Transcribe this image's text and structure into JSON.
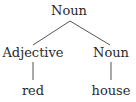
{
  "diagram": {
    "type": "syntax-tree",
    "nodes": {
      "root": {
        "label": "Noun"
      },
      "left": {
        "label": "Adjective"
      },
      "right": {
        "label": "Noun"
      },
      "left_leaf": {
        "label": "red"
      },
      "right_leaf": {
        "label": "house"
      }
    },
    "edges": [
      [
        "root",
        "left"
      ],
      [
        "root",
        "right"
      ],
      [
        "left",
        "left_leaf"
      ],
      [
        "right",
        "right_leaf"
      ]
    ],
    "colors": {
      "text": "#2a2a2a",
      "line": "#555555"
    }
  }
}
